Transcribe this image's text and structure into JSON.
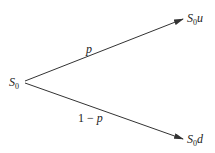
{
  "diagram": {
    "type": "binomial-tree-one-step",
    "root": {
      "base": "S",
      "sub": "0",
      "suffix": ""
    },
    "up_node": {
      "base": "S",
      "sub": "0",
      "suffix": "u"
    },
    "down_node": {
      "base": "S",
      "sub": "0",
      "suffix": "d"
    },
    "up_edge_label": "p",
    "down_edge_label_num": "1 − ",
    "down_edge_label_var": "p",
    "line_color": "#333333"
  }
}
